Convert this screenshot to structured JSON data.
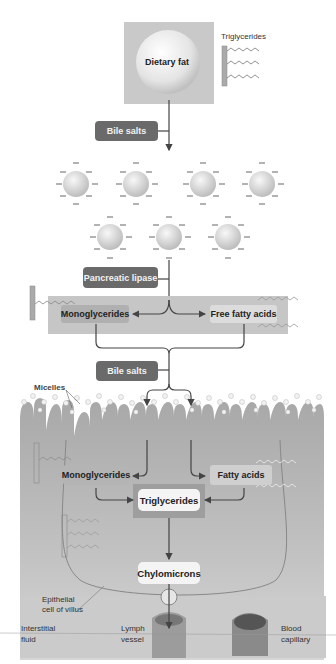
{
  "diagram": {
    "top": {
      "dietary_fat_label": "Dietary fat",
      "triglycerides_legend": "Triglycerides"
    },
    "steps": {
      "bile_salts_1": "Bile salts",
      "pancreatic_lipase": "Pancreatic lipase",
      "monoglycerides_1": "Monoglycerides",
      "free_fatty_acids": "Free fatty acids",
      "bile_salts_2": "Bile salts"
    },
    "cell": {
      "micelles": "Micelles",
      "monoglycerides_2": "Monoglycerides",
      "fatty_acids": "Fatty acids",
      "triglycerides": "Triglycerides",
      "chylomicrons": "Chylomicrons",
      "epithelial_line1": "Epithelial",
      "epithelial_line2": "cell of villus"
    },
    "bottom": {
      "interstitial_line1": "Interstitial",
      "interstitial_line2": "fluid",
      "lymph_line1": "Lymph",
      "lymph_line2": "vessel",
      "blood_line1": "Blood",
      "blood_line2": "capillary"
    },
    "colors": {
      "dark_box": "#6a6a6a",
      "light_panel": "#c8c8c8",
      "cell_gray": "#b5b5b5",
      "arrow": "#444444"
    }
  }
}
